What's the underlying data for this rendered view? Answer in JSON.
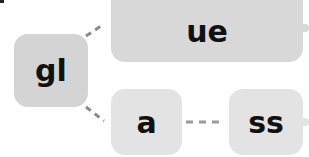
{
  "diagram": {
    "type": "mind-map",
    "root": {
      "label": "gl",
      "color": "#d4d4d4"
    },
    "nodes": [
      {
        "id": "ue",
        "label": "ue",
        "color": "#d8d8d8",
        "parent": "gl"
      },
      {
        "id": "a",
        "label": "a",
        "color": "#e3e3e3",
        "parent": "gl"
      },
      {
        "id": "ss",
        "label": "ss",
        "color": "#e3e3e3",
        "parent": "a"
      }
    ],
    "edge_color": "#8a8a8a",
    "edge_style": "dashed"
  }
}
